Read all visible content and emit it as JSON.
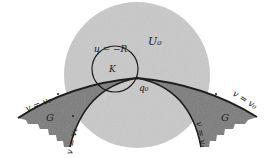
{
  "figure": {
    "labels": {
      "region_U": "U₀",
      "circle_eq": "u = −R",
      "circle_K": "K",
      "point_q": "q₀",
      "curve_left_outer": "v = v₀",
      "curve_right_outer": "v = v₀",
      "curve_left_inner": "v = v₁",
      "curve_right_inner": "v = v₁",
      "region_G_left": "G",
      "region_G_right": "G"
    },
    "colors": {
      "disk_fill": "#c9c9c9",
      "region_G_fill": "#7a7a7a",
      "stroke": "#1e1e1e",
      "background": "#ffffff"
    }
  }
}
